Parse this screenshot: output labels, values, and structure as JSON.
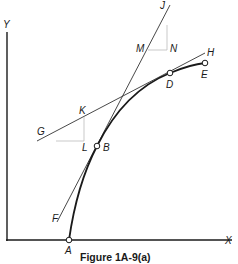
{
  "figure": {
    "caption": "Figure 1A-9(a)",
    "axes": {
      "x_label": "X",
      "y_label": "Y"
    },
    "points": {
      "A": "A",
      "B": "B",
      "D": "D",
      "E": "E",
      "F": "F",
      "G": "G",
      "H": "H",
      "J": "J",
      "K": "K",
      "L": "L",
      "M": "M",
      "N": "N"
    },
    "colors": {
      "line": "#1a1a1a",
      "thin_line": "#444444",
      "helper_line": "#bbbbbb"
    }
  }
}
